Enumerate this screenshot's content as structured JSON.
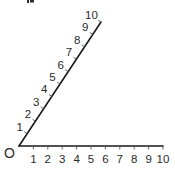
{
  "diagram": {
    "type": "angle-with-scaled-rays",
    "origin_label": "O",
    "top_fragment": "p",
    "horizontal_ray": {
      "tick_labels": [
        "1",
        "2",
        "3",
        "4",
        "5",
        "6",
        "7",
        "8",
        "9",
        "10"
      ]
    },
    "slanted_ray": {
      "tick_labels": [
        "1",
        "2",
        "3",
        "4",
        "5",
        "6",
        "7",
        "8",
        "9",
        "10"
      ]
    },
    "colors": {
      "line": "#1a1a1a",
      "text": "#2a2a2a",
      "background": "#ffffff"
    }
  }
}
